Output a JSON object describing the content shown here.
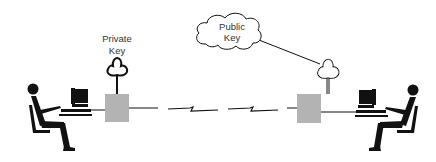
{
  "diagram": {
    "type": "public-key-cryptography-illustration",
    "colors": {
      "ink": "#111111",
      "box_fill": "#b3b3b3",
      "background": "#ffffff",
      "text": "#333333"
    },
    "nodes": [
      {
        "id": "left-user",
        "kind": "seated-person-at-computer",
        "side": "left"
      },
      {
        "id": "left-encryptor",
        "kind": "gray-box",
        "key_label": "Private Key"
      },
      {
        "id": "right-encryptor",
        "kind": "gray-box"
      },
      {
        "id": "right-user",
        "kind": "seated-person-at-computer",
        "side": "right"
      },
      {
        "id": "public-key-cloud",
        "kind": "cloud",
        "label": "Public Key"
      }
    ],
    "edges": [
      {
        "from": "left-user",
        "to": "left-encryptor",
        "style": "line"
      },
      {
        "from": "left-encryptor",
        "to": "right-encryptor",
        "style": "lightning-link"
      },
      {
        "from": "right-encryptor",
        "to": "right-user",
        "style": "line"
      },
      {
        "from": "public-key-cloud",
        "to": "right-encryptor-key",
        "style": "line"
      }
    ]
  },
  "labels": {
    "private_key_line1": "Private",
    "private_key_line2": "Key",
    "public_key_line1": "Public",
    "public_key_line2": "Key"
  }
}
